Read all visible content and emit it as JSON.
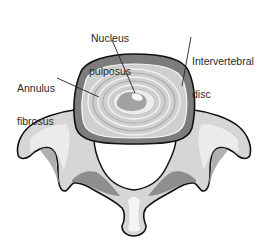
{
  "diagram": {
    "labels": [
      {
        "id": "nucleus",
        "line1": "Nucleus",
        "line2": "pulposus"
      },
      {
        "id": "intervertebral",
        "line1": "Intervertebral",
        "line2": "disc"
      },
      {
        "id": "annulus",
        "line1": "Annulus",
        "line2": "fibrosus"
      }
    ]
  },
  "colors": {
    "outline": "#111111",
    "bone_light": "#e4e4e4",
    "bone_mid": "#b8b8b8",
    "bone_dark": "#8a8a8a",
    "disc_outer": "#7a7a7a",
    "disc_ring": "#c8c8c8",
    "nucleus": "#9a9a9a",
    "text": "#2a2a2a"
  }
}
